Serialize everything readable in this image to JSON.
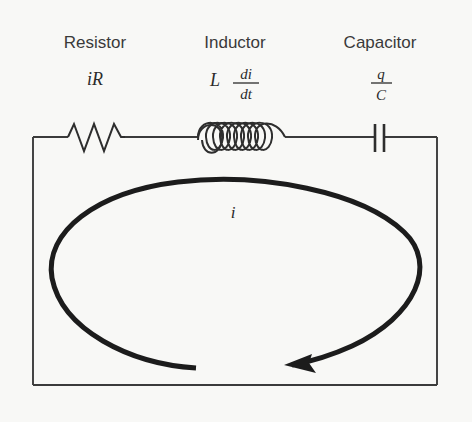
{
  "figure": {
    "background_color": "#f8f8f6",
    "line_color": "#3b3b3b",
    "loop_color": "#1c1c1c",
    "text_color": "#3a3a3a"
  },
  "components": [
    {
      "name": "resistor",
      "label": "Resistor",
      "symbol": "zigzag",
      "formula_plain": "iR",
      "formula": {
        "kind": "inline",
        "text": "iR"
      }
    },
    {
      "name": "inductor",
      "label": "Inductor",
      "symbol": "coil",
      "formula_plain": "L di/dt",
      "formula": {
        "kind": "fraction",
        "prefix": "L",
        "numerator": "di",
        "denominator": "dt"
      }
    },
    {
      "name": "capacitor",
      "label": "Capacitor",
      "symbol": "parallel-plates",
      "formula_plain": "q/C",
      "formula": {
        "kind": "fraction",
        "prefix": "",
        "numerator": "q",
        "denominator": "C"
      }
    }
  ],
  "current": {
    "label": "i",
    "direction": "counterclockwise",
    "arrow": "left-pointing"
  }
}
